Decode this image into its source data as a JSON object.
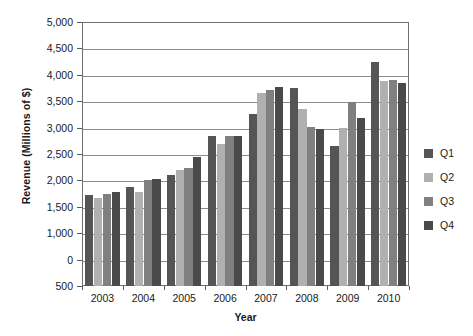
{
  "chart_data": {
    "type": "bar",
    "title": "",
    "xlabel": "Year",
    "ylabel": "Revenue (Millions of $)",
    "categories": [
      "2003",
      "2004",
      "2005",
      "2006",
      "2007",
      "2008",
      "2009",
      "2010"
    ],
    "series": [
      {
        "name": "Q1",
        "color": "#555555",
        "values": [
          2050,
          2180,
          2390,
          3060,
          3430,
          3880,
          2880,
          4310
        ]
      },
      {
        "name": "Q2",
        "color": "#b0b0b0",
        "values": [
          2000,
          2100,
          2470,
          2920,
          3790,
          3520,
          3200,
          4000
        ]
      },
      {
        "name": "Q3",
        "color": "#808080",
        "values": [
          2060,
          2310,
          2510,
          3050,
          3840,
          3210,
          3640,
          4010
        ]
      },
      {
        "name": "Q4",
        "color": "#4a4a4a",
        "values": [
          2100,
          2320,
          2700,
          3060,
          3890,
          3180,
          3370,
          3960
        ]
      }
    ],
    "ytick_labels": [
      "5,000",
      "4,500",
      "4,000",
      "3,500",
      "3,000",
      "2,500",
      "2,000",
      "1,500",
      "1,000",
      "0",
      "500"
    ],
    "ylim": [
      500,
      5000
    ],
    "grid": true,
    "legend_position": "right",
    "legend_entries": [
      "Q1",
      "Q2",
      "Q3",
      "Q4"
    ]
  }
}
